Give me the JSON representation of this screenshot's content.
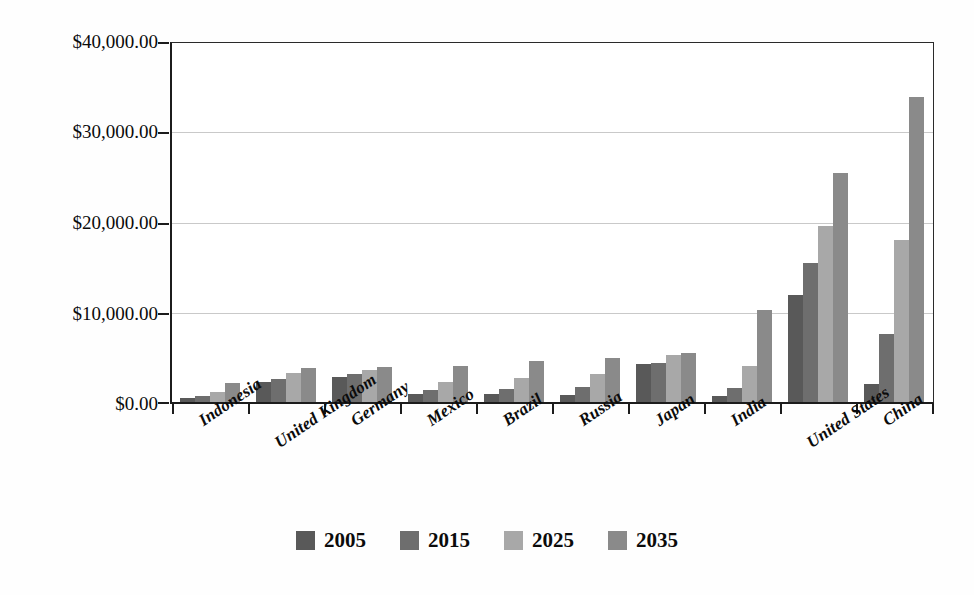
{
  "chart_data": {
    "type": "bar",
    "title": "",
    "subtitle": "",
    "xlabel": "",
    "ylabel": "",
    "ylim": [
      0,
      40000
    ],
    "grid": true,
    "legend_position": "bottom",
    "categories": [
      "Indonesia",
      "United Kingdom",
      "Germany",
      "Mexico",
      "Brazil",
      "Russia",
      "Japan",
      "India",
      "United States",
      "China"
    ],
    "ytick_labels": [
      "$0.00",
      "$10,000.00",
      "$20,000.00",
      "$30,000.00",
      "$40,000.00"
    ],
    "ytick_values": [
      0,
      10000,
      20000,
      30000,
      40000
    ],
    "series": [
      {
        "name": "2005",
        "color": "#595959",
        "values": [
          400,
          2200,
          2800,
          900,
          900,
          800,
          4200,
          700,
          11900,
          2000
        ]
      },
      {
        "name": "2015",
        "color": "#6e6e6e",
        "values": [
          700,
          2600,
          3100,
          1300,
          1500,
          1700,
          4400,
          1600,
          15500,
          7600
        ]
      },
      {
        "name": "2025",
        "color": "#a8a8a8",
        "values": [
          1100,
          3200,
          3600,
          2200,
          2700,
          3100,
          5200,
          4000,
          19600,
          18100
        ]
      },
      {
        "name": "2035",
        "color": "#8a8a8a",
        "values": [
          2100,
          3800,
          3900,
          4000,
          4600,
          4900,
          5500,
          10300,
          25500,
          34000
        ]
      }
    ]
  }
}
